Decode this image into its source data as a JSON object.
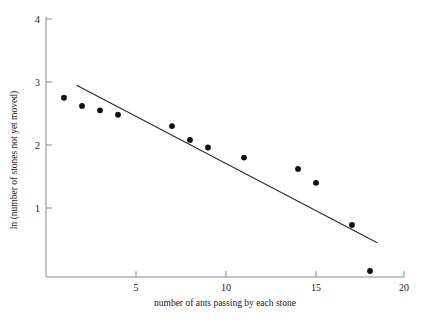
{
  "chart_data": {
    "type": "scatter",
    "title": "",
    "subtitle": "",
    "xlabel": "number of ants passing by each stone",
    "ylabel": "ln (number of stones not yet moved)",
    "xlim": [
      0,
      20.6
    ],
    "ylim": [
      0,
      4.15
    ],
    "grid": false,
    "legend": null,
    "x_ticks": [
      5,
      10,
      15,
      20
    ],
    "x_tick_labels": [
      "5",
      "10",
      "15",
      "20"
    ],
    "y_ticks": [
      1,
      2,
      3,
      4
    ],
    "y_tick_labels": [
      "1",
      "2",
      "3",
      "4"
    ],
    "series": [
      {
        "name": "observed stones",
        "type": "scatter",
        "marker": "filled-circle",
        "color": "#111111",
        "x": [
          1,
          2,
          3,
          4,
          7,
          8,
          9,
          11,
          14,
          15,
          17,
          18
        ],
        "y": [
          2.75,
          2.62,
          2.55,
          2.48,
          2.3,
          2.08,
          1.96,
          1.8,
          1.62,
          1.4,
          0.73,
          0.0
        ]
      },
      {
        "name": "fitted regression line",
        "type": "line",
        "color": "#2b2b2b",
        "x": [
          1.7,
          18.4
        ],
        "y": [
          2.95,
          0.45
        ]
      }
    ]
  },
  "axes": {
    "x_label": "number of ants passing by each stone",
    "y_label": "ln (number of stones not yet moved)",
    "x_tick_labels": [
      "5",
      "10",
      "15",
      "20"
    ],
    "y_tick_labels": [
      "1",
      "2",
      "3",
      "4"
    ]
  }
}
